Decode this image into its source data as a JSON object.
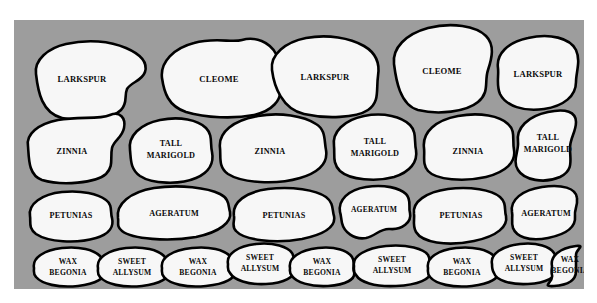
{
  "diagram": {
    "panel": {
      "background_color": "#9d9d9d",
      "bed_fill_color": "#f7f7f7",
      "bed_outline_color": "#000000",
      "x": 14,
      "y": 20,
      "width": 570,
      "height": 269
    },
    "rows": [
      {
        "row_name": "back-row",
        "beds": [
          {
            "label": "LARKSPUR"
          },
          {
            "label": "CLEOME"
          },
          {
            "label": "LARKSPUR"
          },
          {
            "label": "CLEOME"
          },
          {
            "label": "LARKSPUR"
          }
        ]
      },
      {
        "row_name": "second-row",
        "beds": [
          {
            "label": "ZINNIA"
          },
          {
            "label_line1": "TALL",
            "label_line2": "MARIGOLD"
          },
          {
            "label": "ZINNIA"
          },
          {
            "label_line1": "TALL",
            "label_line2": "MARIGOLD"
          },
          {
            "label": "ZINNIA"
          },
          {
            "label_line1": "TALL",
            "label_line2": "MARIGOLD"
          }
        ]
      },
      {
        "row_name": "third-row",
        "beds": [
          {
            "label": "PETUNIAS"
          },
          {
            "label": "AGERATUM"
          },
          {
            "label": "PETUNIAS"
          },
          {
            "label": "AGERATUM"
          },
          {
            "label": "PETUNIAS"
          },
          {
            "label": "AGERATUM"
          }
        ]
      },
      {
        "row_name": "front-row",
        "beds": [
          {
            "label_line1": "WAX",
            "label_line2": "BEGONIA"
          },
          {
            "label_line1": "SWEET",
            "label_line2": "ALLYSUM"
          },
          {
            "label_line1": "WAX",
            "label_line2": "BEGONIA"
          },
          {
            "label_line1": "SWEET",
            "label_line2": "ALLYSUM"
          },
          {
            "label_line1": "WAX",
            "label_line2": "BEGONIA"
          },
          {
            "label_line1": "SWEET",
            "label_line2": "ALLYSUM"
          },
          {
            "label_line1": "WAX",
            "label_line2": "BEGONIA"
          },
          {
            "label_line1": "SWEET",
            "label_line2": "ALLYSUM"
          },
          {
            "label_line1": "WAX",
            "label_line2": "BEGONIA"
          }
        ]
      }
    ]
  }
}
